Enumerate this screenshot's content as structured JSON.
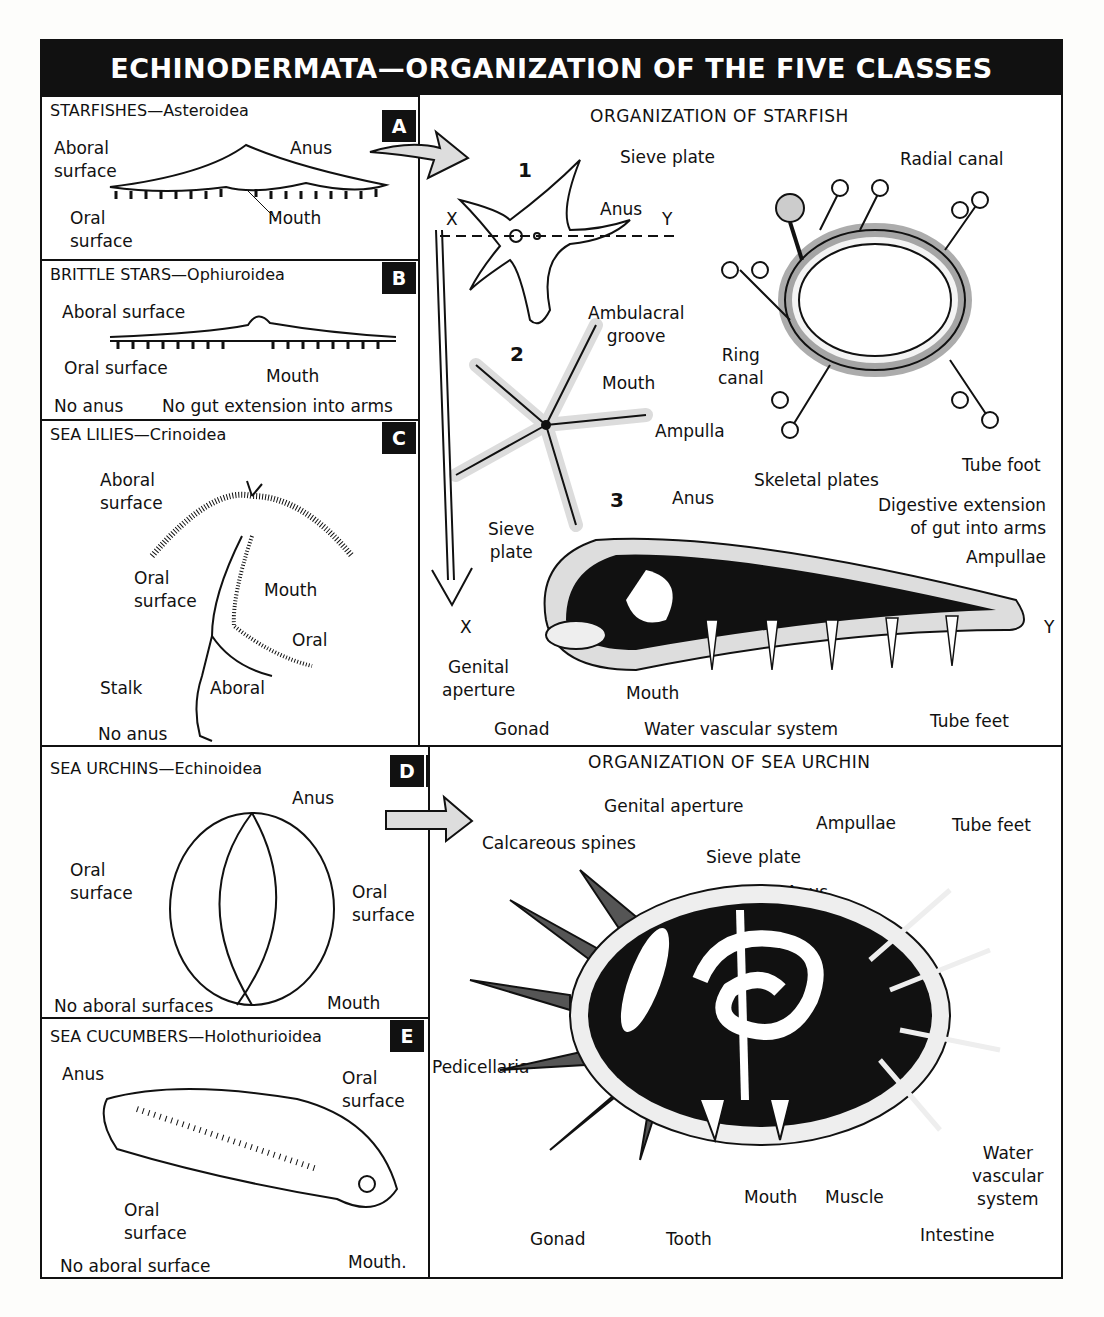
{
  "title": "ECHINODERMATA—ORGANIZATION OF THE FIVE CLASSES",
  "classes": [
    {
      "id": "A",
      "badge": "A",
      "name": "STARFISHES—Asteroidea",
      "labels": {
        "aboral": "Aboral\nsurface",
        "anus": "Anus",
        "oral": "Oral\nsurface",
        "mouth": "Mouth"
      }
    },
    {
      "id": "B",
      "badge": "B",
      "name": "BRITTLE STARS—Ophiuroidea",
      "labels": {
        "aboral": "Aboral surface",
        "oral": "Oral surface",
        "mouth": "Mouth",
        "note1": "No anus",
        "note2": "No gut extension into arms"
      }
    },
    {
      "id": "C",
      "badge": "C",
      "name": "SEA LILIES—Crinoidea",
      "labels": {
        "aboral_surface": "Aboral\nsurface",
        "oral_surface": "Oral\nsurface",
        "mouth": "Mouth",
        "oral": "Oral",
        "stalk": "Stalk",
        "aboral": "Aboral",
        "note": "No anus"
      }
    },
    {
      "id": "D",
      "badge": "D",
      "name": "SEA URCHINS—Echinoidea",
      "labels": {
        "anus": "Anus",
        "oral_left": "Oral\nsurface",
        "oral_right": "Oral\nsurface",
        "mouth": "Mouth",
        "note": "No aboral surfaces"
      }
    },
    {
      "id": "E",
      "badge": "E",
      "name": "SEA CUCUMBERS—Holothurioidea",
      "labels": {
        "anus": "Anus",
        "oral_top": "Oral\nsurface",
        "oral_bottom": "Oral\nsurface",
        "mouth": "Mouth.",
        "note": "No aboral surface"
      }
    }
  ],
  "starfish_detail": {
    "badge": "A′",
    "title": "ORGANIZATION OF STARFISH",
    "fig1": {
      "num": "1",
      "sieve_plate": "Sieve plate",
      "anus": "Anus",
      "x": "X",
      "y": "Y"
    },
    "fig2": {
      "num": "2",
      "ambulacral_groove": "Ambulacral\ngroove",
      "mouth": "Mouth"
    },
    "water": {
      "radial_canal": "Radial canal",
      "water_vascular": "Water\nvascular\nsystem",
      "ring_canal": "Ring\ncanal",
      "ampulla": "Ampulla",
      "tube_foot": "Tube foot"
    },
    "fig3": {
      "num": "3",
      "anus": "Anus",
      "skeletal_plates": "Skeletal plates",
      "digestive": "Digestive extension\nof gut into arms",
      "sieve_plate": "Sieve\nplate",
      "ampullae": "Ampullae",
      "x": "X",
      "y": "Y",
      "genital_aperture": "Genital\naperture",
      "mouth": "Mouth",
      "gonad": "Gonad",
      "water_vascular": "Water vascular system",
      "tube_feet": "Tube feet"
    }
  },
  "urchin_detail": {
    "badge": "D′",
    "title": "ORGANIZATION OF SEA URCHIN",
    "labels": {
      "genital_aperture": "Genital aperture",
      "calcareous_spines": "Calcareous spines",
      "sieve_plate": "Sieve plate",
      "ampullae": "Ampullae",
      "tube_feet": "Tube feet",
      "anus": "Anus",
      "pedicellaria": "Pedicellaria",
      "water_vascular": "Water\nvascular\nsystem",
      "mouth": "Mouth",
      "muscle": "Muscle",
      "gonad": "Gonad",
      "tooth": "Tooth",
      "intestine": "Intestine"
    }
  }
}
